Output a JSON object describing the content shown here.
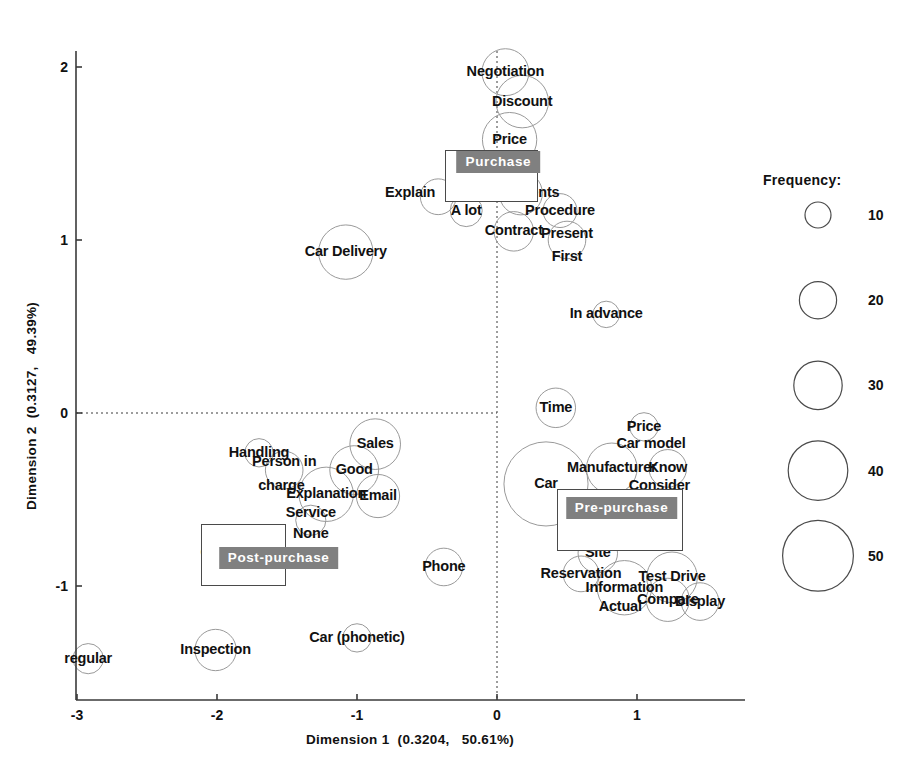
{
  "chart_data": {
    "type": "scatter",
    "title": "",
    "xlabel": "Dimension 1  (0.3204,   50.61%)",
    "ylabel": "Dimension 2  (0.3127,   49.39%)",
    "xlim": [
      -3.15,
      1.55
    ],
    "ylim": [
      -1.55,
      2.22
    ],
    "xticks": [
      "-3",
      "-2",
      "-1",
      "0",
      "1"
    ],
    "xtick_values": [
      -3,
      -2,
      -1,
      0,
      1
    ],
    "yticks": [
      "2",
      "1",
      "0",
      "-1"
    ],
    "ytick_values": [
      2,
      1,
      0,
      -1
    ],
    "grid": false,
    "zero_lines": "dotted",
    "size_encoding": "frequency",
    "legend_position": "right",
    "points": [
      {
        "label": "Negotiation",
        "x": 0.06,
        "y": 1.97,
        "freq": 22,
        "label_dx": 0,
        "label_dy": 0
      },
      {
        "label": "Discount",
        "x": 0.18,
        "y": 1.8,
        "freq": 25,
        "label_dx": 0,
        "label_dy": 0
      },
      {
        "label": "Price",
        "x": 0.09,
        "y": 1.58,
        "freq": 26,
        "label_dx": 0,
        "label_dy": 0
      },
      {
        "label": "Documents",
        "x": 0.17,
        "y": 1.27,
        "freq": 20,
        "label_dx": 0,
        "label_dy": 0
      },
      {
        "label": "Explain",
        "x": -0.42,
        "y": 1.25,
        "freq": 16,
        "label_dx": -28,
        "label_dy": -4
      },
      {
        "label": "A lot",
        "x": -0.22,
        "y": 1.17,
        "freq": 14,
        "label_dx": 0,
        "label_dy": 0
      },
      {
        "label": "Procedure",
        "x": 0.45,
        "y": 1.17,
        "freq": 15,
        "label_dx": 0,
        "label_dy": 0
      },
      {
        "label": "Contract",
        "x": 0.12,
        "y": 1.05,
        "freq": 18,
        "label_dx": 0,
        "label_dy": 0
      },
      {
        "label": "Present",
        "x": 0.5,
        "y": 1.0,
        "freq": 17,
        "label_dx": 0,
        "label_dy": -6
      },
      {
        "label": "First",
        "x": 0.5,
        "y": 0.9,
        "freq": 0,
        "label_dx": 0,
        "label_dy": 0
      },
      {
        "label": "Car Delivery",
        "x": -1.08,
        "y": 0.93,
        "freq": 26,
        "label_dx": 0,
        "label_dy": 0
      },
      {
        "label": "In advance",
        "x": 0.78,
        "y": 0.57,
        "freq": 11,
        "label_dx": 0,
        "label_dy": 0
      },
      {
        "label": "Time",
        "x": 0.42,
        "y": 0.03,
        "freq": 18,
        "label_dx": 0,
        "label_dy": 0
      },
      {
        "label": "Price",
        "x": 1.05,
        "y": -0.08,
        "freq": 12,
        "label_dx": 0,
        "label_dy": 0
      },
      {
        "label": "Car model",
        "x": 1.1,
        "y": -0.18,
        "freq": 0,
        "label_dx": 0,
        "label_dy": 0
      },
      {
        "label": "Sales",
        "x": -0.87,
        "y": -0.18,
        "freq": 24,
        "label_dx": 0,
        "label_dy": 0
      },
      {
        "label": "Handling",
        "x": -1.7,
        "y": -0.23,
        "freq": 12,
        "label_dx": 0,
        "label_dy": 0
      },
      {
        "label": "Person in",
        "x": -1.52,
        "y": -0.33,
        "freq": 17,
        "label_dx": 0,
        "label_dy": -8
      },
      {
        "label": "charge",
        "x": -1.54,
        "y": -0.42,
        "freq": 0,
        "label_dx": 0,
        "label_dy": 0
      },
      {
        "label": "Good",
        "x": -1.02,
        "y": -0.33,
        "freq": 23,
        "label_dx": 0,
        "label_dy": 0
      },
      {
        "label": "Manufacturer",
        "x": 0.82,
        "y": -0.32,
        "freq": 24,
        "label_dx": 0,
        "label_dy": 0
      },
      {
        "label": "Know",
        "x": 1.22,
        "y": -0.32,
        "freq": 17,
        "label_dx": 0,
        "label_dy": 0
      },
      {
        "label": "Consider",
        "x": 1.16,
        "y": -0.42,
        "freq": 0,
        "label_dx": 0,
        "label_dy": 0
      },
      {
        "label": "Explanation",
        "x": -1.22,
        "y": -0.47,
        "freq": 26,
        "label_dx": 0,
        "label_dy": 0
      },
      {
        "label": "Email",
        "x": -0.85,
        "y": -0.48,
        "freq": 20,
        "label_dx": 0,
        "label_dy": 0
      },
      {
        "label": "Car",
        "x": 0.35,
        "y": -0.41,
        "freq": 42,
        "label_dx": 0,
        "label_dy": 0
      },
      {
        "label": "Service",
        "x": -1.33,
        "y": -0.62,
        "freq": 13,
        "label_dx": 0,
        "label_dy": -7
      },
      {
        "label": "None",
        "x": -1.33,
        "y": -0.7,
        "freq": 0,
        "label_dx": 0,
        "label_dy": 0
      },
      {
        "label": "WEB",
        "x": 0.84,
        "y": -0.68,
        "freq": 16,
        "label_dx": 0,
        "label_dy": 0
      },
      {
        "label": "Contact",
        "x": -1.93,
        "y": -0.81,
        "freq": 20,
        "label_dx": 0,
        "label_dy": 0
      },
      {
        "label": "Site",
        "x": 0.72,
        "y": -0.81,
        "freq": 18,
        "label_dx": 0,
        "label_dy": 0
      },
      {
        "label": "Phone",
        "x": -0.38,
        "y": -0.89,
        "freq": 17,
        "label_dx": 0,
        "label_dy": 0
      },
      {
        "label": "Reservation",
        "x": 0.6,
        "y": -0.93,
        "freq": 16,
        "label_dx": 0,
        "label_dy": 0
      },
      {
        "label": "Test Drive",
        "x": 1.25,
        "y": -0.95,
        "freq": 24,
        "label_dx": 0,
        "label_dy": 0
      },
      {
        "label": "Information",
        "x": 0.91,
        "y": -1.01,
        "freq": 26,
        "label_dx": 0,
        "label_dy": 0
      },
      {
        "label": "Compare",
        "x": 1.22,
        "y": -1.08,
        "freq": 20,
        "label_dx": 0,
        "label_dy": 0
      },
      {
        "label": "Actual",
        "x": 0.88,
        "y": -1.12,
        "freq": 0,
        "label_dx": 0,
        "label_dy": 0
      },
      {
        "label": "Display",
        "x": 1.45,
        "y": -1.09,
        "freq": 17,
        "label_dx": 0,
        "label_dy": 0
      },
      {
        "label": "Car (phonetic)",
        "x": -1.0,
        "y": -1.3,
        "freq": 12,
        "label_dx": 0,
        "label_dy": 0
      },
      {
        "label": "Inspection",
        "x": -2.01,
        "y": -1.37,
        "freq": 19,
        "label_dx": 0,
        "label_dy": 0
      },
      {
        "label": "regular",
        "x": -2.92,
        "y": -1.42,
        "freq": 13,
        "label_dx": 0,
        "label_dy": 0
      }
    ],
    "groups": [
      {
        "name": "Purchase",
        "tag_x": 0.01,
        "tag_y": 1.45,
        "box_x": -0.04,
        "box_y": 1.37,
        "box_w": 0.66,
        "box_h": 0.3
      },
      {
        "name": "Pre-purchase",
        "tag_x": 0.89,
        "tag_y": -0.55,
        "box_x": 0.88,
        "box_y": -0.62,
        "box_w": 0.9,
        "box_h": 0.36
      },
      {
        "name": "Post-purchase",
        "tag_x": -1.56,
        "tag_y": -0.84,
        "box_x": -1.81,
        "box_y": -0.82,
        "box_w": 0.61,
        "box_h": 0.36
      }
    ],
    "legend": {
      "title": "Frequency:",
      "items": [
        {
          "value": "10",
          "freq": 10
        },
        {
          "value": "20",
          "freq": 20
        },
        {
          "value": "30",
          "freq": 30
        },
        {
          "value": "40",
          "freq": 40
        },
        {
          "value": "50",
          "freq": 50
        }
      ]
    },
    "colors": {
      "circle_stroke": "#9a9a9a",
      "axis": "#3a3a3a",
      "text": "#111111",
      "group_tag_bg": "#808080",
      "group_tag_text": "#ffffff",
      "legend_stroke": "#4a4a4a"
    }
  }
}
